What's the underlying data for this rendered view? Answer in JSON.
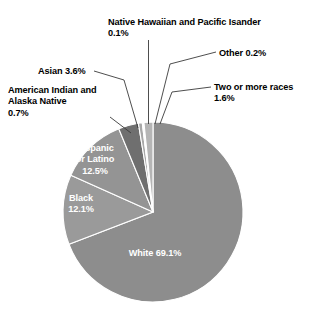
{
  "chart_data": {
    "type": "pie",
    "title": "",
    "subtitle": "",
    "xlabel": "",
    "ylabel": "",
    "legend_position": "none",
    "grid": false,
    "categories": [
      "White",
      "Hispanic or Latino",
      "Black",
      "Asian",
      "Two or more races",
      "American Indian and Alaska Native",
      "Other",
      "Native Hawaiian and Pacific Isander"
    ],
    "values": [
      69.1,
      12.5,
      12.1,
      3.6,
      1.6,
      0.7,
      0.2,
      0.1
    ],
    "units": "percent",
    "slices": [
      {
        "name": "White",
        "value": 69.1,
        "display": "White 69.1%",
        "color": "#8d8d8d",
        "label_placement": "inside"
      },
      {
        "name": "Hispanic or Latino",
        "value": 12.5,
        "display": "Hispanic\nor Latino\n12.5%",
        "color": "#9a9a9a",
        "label_placement": "inside"
      },
      {
        "name": "Black",
        "value": 12.1,
        "display": "Black\n12.1%",
        "color": "#949494",
        "label_placement": "inside"
      },
      {
        "name": "Asian",
        "value": 3.6,
        "display": "Asian  3.6%",
        "color": "#6f6f6f",
        "label_placement": "outside"
      },
      {
        "name": "American Indian and Alaska Native",
        "value": 0.7,
        "display": "American Indian and\nAlaska Native\n0.7%",
        "color": "#a8a8a8",
        "label_placement": "outside"
      },
      {
        "name": "Native Hawaiian and Pacific Isander",
        "value": 0.1,
        "display": "Native Hawaiian and Pacific Isander\n0.1%",
        "color": "#bdbdbd",
        "label_placement": "outside"
      },
      {
        "name": "Other",
        "value": 0.2,
        "display": "Other 0.2%",
        "color": "#a0a0a0",
        "label_placement": "outside"
      },
      {
        "name": "Two or more races",
        "value": 1.6,
        "display": "Two or more races\n1.6%",
        "color": "#b5b5b5",
        "label_placement": "outside"
      }
    ]
  },
  "labels": {
    "native_hawaiian": "Native Hawaiian and Pacific Isander\n0.1%",
    "other": "Other 0.2%",
    "asian": "Asian  3.6%",
    "two_or_more_races": "Two or more races\n1.6%",
    "american_indian": "American Indian and\nAlaska Native\n0.7%",
    "hispanic_or_latino": "Hispanic\nor Latino\n12.5%",
    "black": "Black\n12.1%",
    "white": "White 69.1%"
  },
  "style": {
    "background": "#ffffff",
    "slice_separator": "#ffffff",
    "leader_line": "#3a3a3a",
    "inside_text": "#ffffff",
    "outside_text": "#000000"
  }
}
